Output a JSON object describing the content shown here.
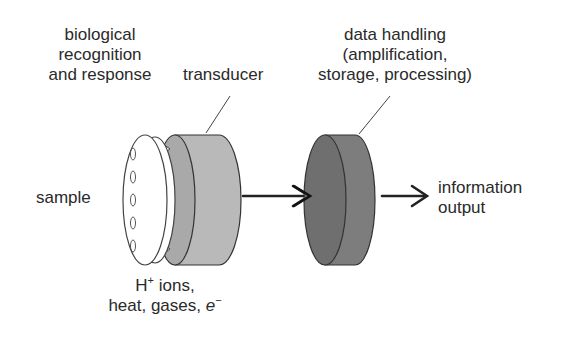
{
  "diagram": {
    "labels": {
      "biological_recognition": [
        "biological",
        "recognition",
        "and response"
      ],
      "transducer": "transducer",
      "data_handling": [
        "data handling",
        "(amplification,",
        "storage, processing)"
      ],
      "sample": "sample",
      "information_output": [
        "information",
        "output"
      ],
      "ions_line1_base": "H",
      "ions_line1_sup": "+",
      "ions_line1_rest": " ions,",
      "ions_line2_base": "heat, gases, ",
      "ions_line2_e": "e",
      "ions_line2_sup": "−"
    },
    "colors": {
      "transducer_fill": "#b8b8b8",
      "transducer_face": "#a8a8a8",
      "data_fill": "#7c7c7c",
      "data_face": "#6e6e6e",
      "stroke": "#333333",
      "disc_fill": "#ffffff"
    },
    "flow": [
      "sample",
      "biological recognition and response",
      "transducer",
      "data handling",
      "information output"
    ]
  }
}
